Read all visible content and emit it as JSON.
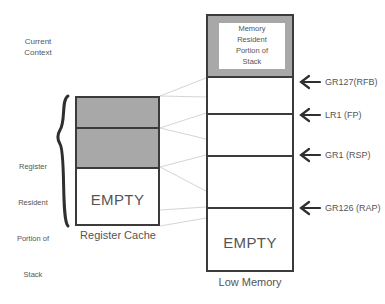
{
  "diagram": {
    "register_cache": {
      "caption": "Register Cache",
      "bracket_label": "Register\nResident\nPortion of\nStack",
      "bracket_label_lines": [
        "Register",
        "Resident",
        "Portion of",
        "Stack"
      ],
      "current_context_label": "Current\nContext",
      "current_context_lines": [
        "Current",
        "Context"
      ],
      "empty_label": "EMPTY",
      "arrow_icon": "down-arrow-icon",
      "shaded_color": "#a8a8a8",
      "border_color": "#3b3b3b"
    },
    "memory_column": {
      "caption": "Low Memory",
      "memory_resident_label": "Memory\nResident\nPortion of\nStack",
      "memory_resident_lines": [
        "Memory",
        "Resident",
        "Portion of",
        "Stack"
      ],
      "empty_label": "EMPTY",
      "shaded_color": "#a8a8a8",
      "border_color": "#3b3b3b"
    },
    "pointers": [
      {
        "label": "GR127(RFB)",
        "icon": "left-arrow-icon"
      },
      {
        "label": "LR1 (FP)",
        "icon": "left-arrow-icon"
      },
      {
        "label": "GR1 (RSP)",
        "icon": "left-arrow-icon"
      },
      {
        "label": "GR126 (RAP)",
        "icon": "left-arrow-icon"
      }
    ]
  }
}
